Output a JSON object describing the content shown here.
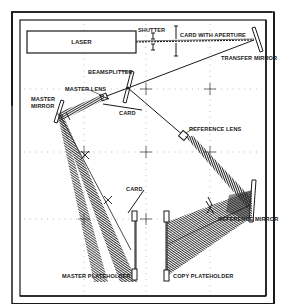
{
  "diagram": {
    "type": "holographic-optical-bench-layout",
    "colors": {
      "ink": "#1a1a1a",
      "background": "#ffffff",
      "beam_hatch": "#333333",
      "grid_dots": "#888888"
    },
    "labels": {
      "laser": "LASER",
      "shutter": "SHUTTER",
      "card_with_aperture": "CARD WITH APERTURE",
      "transfer_mirror": "TRANSFER MIRROR",
      "beamsplitter": "BEAMSPLITTER",
      "master_lens": "MASTER LENS",
      "card_top": "CARD",
      "master_mirror_line1": "MASTER",
      "master_mirror_line2": "MIRROR",
      "reference_lens": "REFERENCE LENS",
      "card_bottom": "CARD",
      "reference_mirror": "REFERENCE MIRROR",
      "master_plateholder": "MASTER PLATEHOLDER",
      "copy_plateholder": "COPY PLATEHOLDER"
    },
    "components": [
      {
        "id": "laser",
        "label": "LASER"
      },
      {
        "id": "shutter",
        "label": "SHUTTER"
      },
      {
        "id": "card-with-aperture",
        "label": "CARD WITH APERTURE"
      },
      {
        "id": "transfer-mirror",
        "label": "TRANSFER MIRROR"
      },
      {
        "id": "beamsplitter",
        "label": "BEAMSPLITTER"
      },
      {
        "id": "master-lens",
        "label": "MASTER LENS"
      },
      {
        "id": "card-1",
        "label": "CARD"
      },
      {
        "id": "master-mirror",
        "label": "MASTER MIRROR"
      },
      {
        "id": "reference-lens",
        "label": "REFERENCE LENS"
      },
      {
        "id": "card-2",
        "label": "CARD"
      },
      {
        "id": "reference-mirror",
        "label": "REFERENCE MIRROR"
      },
      {
        "id": "master-plateholder",
        "label": "MASTER PLATEHOLDER"
      },
      {
        "id": "copy-plateholder",
        "label": "COPY PLATEHOLDER"
      }
    ],
    "beam_path": [
      "laser",
      "shutter",
      "card-with-aperture",
      "transfer-mirror",
      "beamsplitter",
      "master-lens",
      "master-mirror",
      "master-plateholder",
      "reference-lens",
      "reference-mirror",
      "copy-plateholder"
    ]
  }
}
